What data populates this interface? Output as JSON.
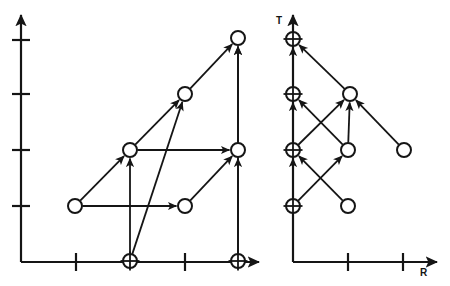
{
  "figure": {
    "title": "",
    "panels": [
      {
        "id": "left-panel",
        "name": "left-graph-panel",
        "axis": {
          "x_label": "",
          "y_label": "",
          "origin": [
            21,
            262
          ],
          "x_arrow_tip": [
            259,
            262
          ],
          "y_arrow_tip": [
            21,
            15
          ],
          "x_ticks": [
            76,
            185
          ],
          "y_ticks": [
            40,
            94,
            150,
            206
          ]
        },
        "nodes": [
          {
            "id": "L1",
            "kind": "open",
            "cx": 75,
            "cy": 206,
            "r": 7
          },
          {
            "id": "L2",
            "kind": "open",
            "cx": 130,
            "cy": 150,
            "r": 7
          },
          {
            "id": "L3",
            "kind": "open",
            "cx": 185,
            "cy": 206,
            "r": 7
          },
          {
            "id": "L4",
            "kind": "open",
            "cx": 185,
            "cy": 94,
            "r": 7
          },
          {
            "id": "L5",
            "kind": "open",
            "cx": 238,
            "cy": 150,
            "r": 7
          },
          {
            "id": "L6",
            "kind": "open",
            "cx": 238,
            "cy": 38,
            "r": 7
          },
          {
            "id": "L7",
            "kind": "plus",
            "cx": 130,
            "cy": 261,
            "r": 7
          },
          {
            "id": "L8",
            "kind": "plus",
            "cx": 238,
            "cy": 261,
            "r": 7
          }
        ],
        "edges": [
          {
            "from": "L1",
            "to": "L2"
          },
          {
            "from": "L1",
            "to": "L3"
          },
          {
            "from": "L2",
            "to": "L4"
          },
          {
            "from": "L2",
            "to": "L5"
          },
          {
            "from": "L3",
            "to": "L5"
          },
          {
            "from": "L4",
            "to": "L6"
          },
          {
            "from": "L5",
            "to": "L6"
          },
          {
            "from": "L7",
            "to": "L2"
          },
          {
            "from": "L7",
            "to": "L4"
          },
          {
            "from": "L8",
            "to": "L5"
          },
          {
            "from": "L8",
            "to": "L6"
          }
        ]
      },
      {
        "id": "right-panel",
        "name": "right-graph-panel",
        "axis": {
          "x_label": "R",
          "y_label": "T",
          "origin": [
            293,
            262
          ],
          "x_arrow_tip": [
            437,
            262
          ],
          "y_arrow_tip": [
            293,
            15
          ],
          "x_ticks": [
            348,
            403
          ],
          "y_ticks": []
        },
        "nodes": [
          {
            "id": "R1",
            "kind": "plus",
            "cx": 293,
            "cy": 206,
            "r": 7
          },
          {
            "id": "R2",
            "kind": "plus",
            "cx": 293,
            "cy": 150,
            "r": 7
          },
          {
            "id": "R3",
            "kind": "plus",
            "cx": 293,
            "cy": 94,
            "r": 7
          },
          {
            "id": "R4",
            "kind": "plus",
            "cx": 293,
            "cy": 39,
            "r": 7
          },
          {
            "id": "R5",
            "kind": "open",
            "cx": 348,
            "cy": 206,
            "r": 7
          },
          {
            "id": "R6",
            "kind": "open",
            "cx": 348,
            "cy": 150,
            "r": 7
          },
          {
            "id": "R7",
            "kind": "open",
            "cx": 350,
            "cy": 94,
            "r": 7
          },
          {
            "id": "R8",
            "kind": "open",
            "cx": 404,
            "cy": 150,
            "r": 7
          }
        ],
        "edges": [
          {
            "from": "R1",
            "to": "R2"
          },
          {
            "from": "R2",
            "to": "R3"
          },
          {
            "from": "R3",
            "to": "R4"
          },
          {
            "from": "R1",
            "to": "R6"
          },
          {
            "from": "R5",
            "to": "R2"
          },
          {
            "from": "R2",
            "to": "R7"
          },
          {
            "from": "R6",
            "to": "R3"
          },
          {
            "from": "R6",
            "to": "R7"
          },
          {
            "from": "R8",
            "to": "R7"
          },
          {
            "from": "R7",
            "to": "R4"
          }
        ]
      }
    ],
    "colors": {
      "ink": "#151515",
      "background": "#ffffff"
    },
    "node_kinds": {
      "open": "open-circle-node",
      "plus": "circled-plus-node"
    }
  }
}
